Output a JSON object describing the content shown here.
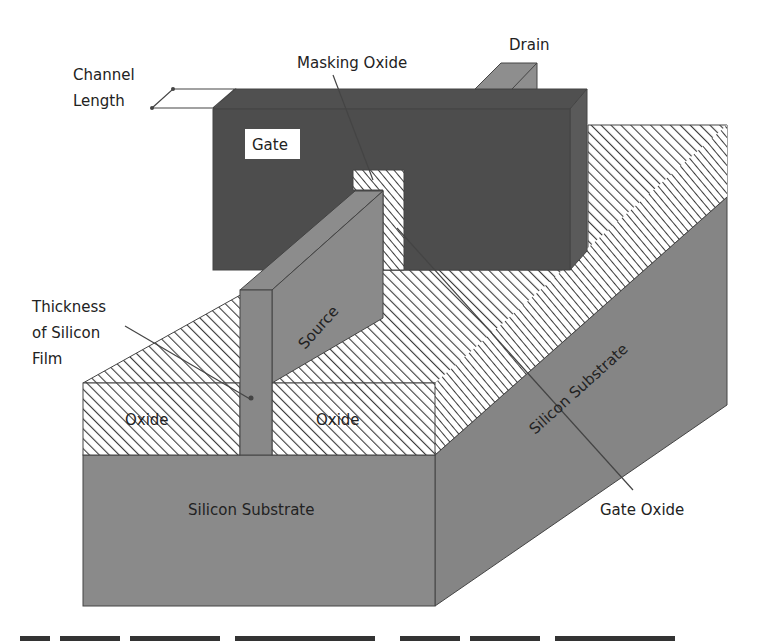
{
  "figure": {
    "colors": {
      "gate": "#4d4d4d",
      "gate_side": "#5a5a5a",
      "silicon": "#8a8a8a",
      "silicon_side": "#858585",
      "source": "#8c8c8c",
      "drain": "#8e8e8e",
      "oxide_hatch_line": "#3c3c3c",
      "oxide_background": "#ffffff",
      "label_text": "#222222",
      "background": "#ffffff"
    },
    "labels": {
      "channel_length": [
        "Channel",
        "Length"
      ],
      "masking_oxide": "Masking Oxide",
      "drain": "Drain",
      "gate": "Gate",
      "source": "Source",
      "thickness": [
        "Thickness",
        "of Silicon",
        "Film"
      ],
      "oxide_left": "Oxide",
      "oxide_right": "Oxide",
      "substrate_front": "Silicon Substrate",
      "substrate_side": "Silicon Substrate",
      "gate_oxide": "Gate Oxide"
    },
    "caption_partial": "(caption cut off at bottom edge)"
  }
}
